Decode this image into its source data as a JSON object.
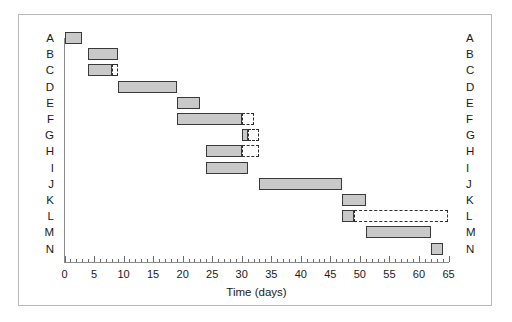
{
  "figure": {
    "frame_color": "#b9b9b9",
    "background": "#ffffff"
  },
  "chart_data": {
    "type": "bar",
    "subtype": "gantt",
    "title": "",
    "xlabel": "Time (days)",
    "ylabel": "",
    "xlim": [
      0,
      65
    ],
    "ylim_categories": [
      "A",
      "B",
      "C",
      "D",
      "E",
      "F",
      "G",
      "H",
      "I",
      "J",
      "K",
      "L",
      "M",
      "N"
    ],
    "x_major_ticks": [
      0,
      5,
      10,
      15,
      20,
      25,
      30,
      35,
      40,
      45,
      50,
      55,
      60,
      65
    ],
    "x_major_tick_labels": [
      "0",
      "5",
      "10",
      "15",
      "20",
      "25",
      "30",
      "35",
      "40",
      "45",
      "50",
      "55",
      "60",
      "65"
    ],
    "x_minor_tick_interval": 1,
    "grid": false,
    "legend": null,
    "bar_fill_color": "#c9c9c9",
    "bar_edge_color": "#3a3a3a",
    "slack_edge_color": "#2f2f2f",
    "categories": [
      "A",
      "B",
      "C",
      "D",
      "E",
      "F",
      "G",
      "H",
      "I",
      "J",
      "K",
      "L",
      "M",
      "N"
    ],
    "tasks": [
      {
        "label": "A",
        "start": 0,
        "end": 3,
        "duration": 3,
        "slack_end": null
      },
      {
        "label": "B",
        "start": 4,
        "end": 9,
        "duration": 5,
        "slack_end": null
      },
      {
        "label": "C",
        "start": 4,
        "end": 8,
        "duration": 4,
        "slack_end": 9
      },
      {
        "label": "D",
        "start": 9,
        "end": 19,
        "duration": 10,
        "slack_end": null
      },
      {
        "label": "E",
        "start": 19,
        "end": 23,
        "duration": 4,
        "slack_end": null
      },
      {
        "label": "F",
        "start": 19,
        "end": 30,
        "duration": 11,
        "slack_end": 32
      },
      {
        "label": "G",
        "start": 30,
        "end": 31,
        "duration": 1,
        "slack_end": 33
      },
      {
        "label": "H",
        "start": 24,
        "end": 30,
        "duration": 6,
        "slack_end": 33
      },
      {
        "label": "I",
        "start": 24,
        "end": 31,
        "duration": 7,
        "slack_end": null
      },
      {
        "label": "J",
        "start": 33,
        "end": 47,
        "duration": 14,
        "slack_end": null
      },
      {
        "label": "K",
        "start": 47,
        "end": 51,
        "duration": 4,
        "slack_end": null
      },
      {
        "label": "L",
        "start": 47,
        "end": 49,
        "duration": 2,
        "slack_end": 65
      },
      {
        "label": "M",
        "start": 51,
        "end": 62,
        "duration": 11,
        "slack_end": null
      },
      {
        "label": "N",
        "start": 62,
        "end": 64,
        "duration": 2,
        "slack_end": null
      }
    ]
  },
  "left_axis_labels": [
    "A",
    "B",
    "C",
    "D",
    "E",
    "F",
    "G",
    "H",
    "I",
    "J",
    "K",
    "L",
    "M",
    "N"
  ],
  "right_axis_labels": [
    "A",
    "B",
    "C",
    "D",
    "E",
    "F",
    "G",
    "H",
    "I",
    "J",
    "K",
    "L",
    "M",
    "N"
  ]
}
